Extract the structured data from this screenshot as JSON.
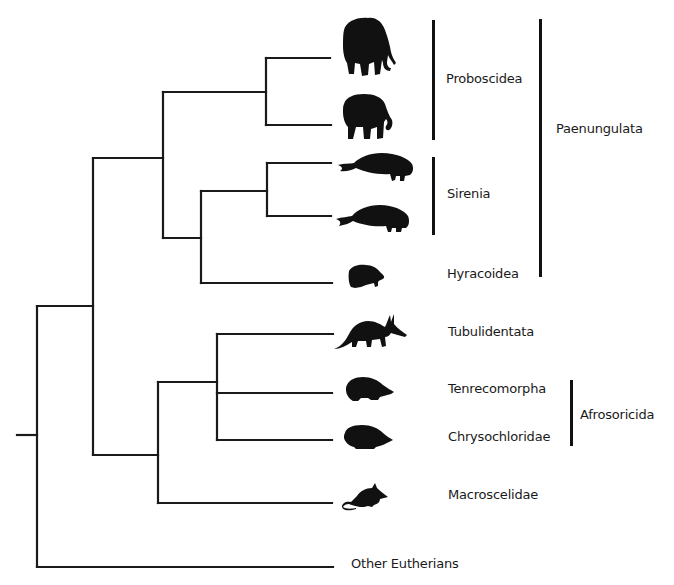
{
  "taxa": [
    {
      "id": "mammoth",
      "icon": "mammoth-icon",
      "y": 58
    },
    {
      "id": "elephant",
      "icon": "elephant-icon",
      "y": 125
    },
    {
      "id": "dugong",
      "icon": "dugong-icon",
      "y": 163
    },
    {
      "id": "manatee",
      "icon": "manatee-icon",
      "y": 216
    },
    {
      "id": "hyrax",
      "icon": "hyrax-icon",
      "label": "Hyracoidea",
      "y": 283
    },
    {
      "id": "aardvark",
      "icon": "aardvark-icon",
      "label": "Tubulidentata",
      "y": 334
    },
    {
      "id": "tenrec",
      "icon": "tenrec-icon",
      "label": "Tenrecomorpha",
      "y": 393
    },
    {
      "id": "golden-mole",
      "icon": "golden-mole-icon",
      "label": "Chrysochloridae",
      "y": 440
    },
    {
      "id": "elephant-shrew",
      "icon": "elephant-shrew-icon",
      "label": "Macroscelidae",
      "y": 503
    },
    {
      "id": "other",
      "label": "Other Eutherians",
      "y": 567
    }
  ],
  "labels": {
    "proboscidea": "Proboscidea",
    "sirenia": "Sirenia",
    "hyracoidea": "Hyracoidea",
    "paenungulata": "Paenungulata",
    "tubulidentata": "Tubulidentata",
    "tenrecomorpha": "Tenrecomorpha",
    "chrysochloridae": "Chrysochloridae",
    "afrosoricida": "Afrosoricida",
    "macroscelidae": "Macroscelidae",
    "other_eutherians": "Other Eutherians"
  },
  "groups": [
    {
      "name": "Proboscidea",
      "members": [
        "mammoth",
        "elephant"
      ]
    },
    {
      "name": "Sirenia",
      "members": [
        "dugong",
        "manatee"
      ]
    },
    {
      "name": "Paenungulata",
      "members": [
        "Proboscidea",
        "Sirenia",
        "Hyracoidea"
      ]
    },
    {
      "name": "Afrosoricida",
      "members": [
        "Tenrecomorpha",
        "Chrysochloridae"
      ]
    }
  ],
  "colors": {
    "line": "#111111",
    "text": "#1a1a1a",
    "background": "#ffffff"
  }
}
